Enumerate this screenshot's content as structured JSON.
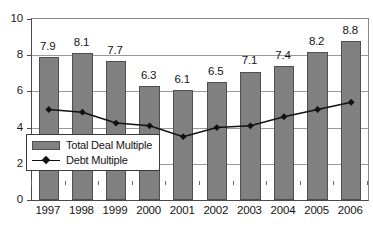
{
  "chart_data": {
    "type": "bar",
    "title": "",
    "subtitle": "",
    "xlabel": "",
    "ylabel": "",
    "categories": [
      "1997",
      "1998",
      "1999",
      "2000",
      "2001",
      "2002",
      "2003",
      "2004",
      "2005",
      "2006"
    ],
    "ylim": [
      0,
      10
    ],
    "yticks": [
      0,
      2,
      4,
      6,
      8,
      10
    ],
    "ytick_labels": [
      "0",
      "2",
      "4",
      "6",
      "8",
      "10"
    ],
    "grid": true,
    "grid_axis": "y",
    "legend_position": "inside lower-left",
    "series": [
      {
        "name": "Total Deal Multiple",
        "type": "bar",
        "color": "#808080",
        "values": [
          7.9,
          8.1,
          7.7,
          6.3,
          6.1,
          6.5,
          7.1,
          7.4,
          8.2,
          8.8
        ],
        "data_labels": [
          "7.9",
          "8.1",
          "7.7",
          "6.3",
          "6.1",
          "6.5",
          "7.1",
          "7.4",
          "8.2",
          "8.8"
        ]
      },
      {
        "name": "Debt Multiple",
        "type": "line",
        "color": "#111111",
        "marker": "diamond",
        "values": [
          5.0,
          4.85,
          4.25,
          4.1,
          3.5,
          4.0,
          4.1,
          4.6,
          5.0,
          5.4
        ],
        "data_labels": []
      }
    ]
  },
  "legend": {
    "items": [
      {
        "label": "Total Deal Multiple",
        "swatch": "bar-swatch",
        "color": "#808080"
      },
      {
        "label": "Debt Multiple",
        "swatch": "line-swatch",
        "color": "#111111"
      }
    ]
  }
}
